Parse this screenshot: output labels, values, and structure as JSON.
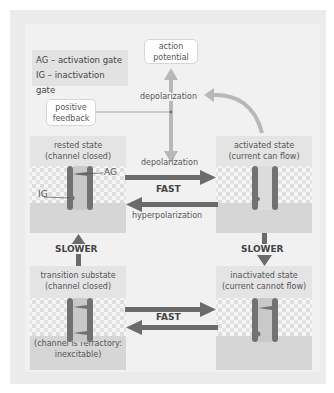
{
  "legend": {
    "ag": "AG – activation gate",
    "ig": "IG – inactivation gate"
  },
  "bubbles": {
    "action_potential": [
      "action",
      "potential"
    ],
    "positive_feedback": [
      "positive",
      "feedback"
    ]
  },
  "labels": {
    "depolarization_top": "depolarization",
    "depolarization_mid": "depolarization",
    "hyperpolarization": "hyperpolarization",
    "fast_top": "FAST",
    "fast_bottom": "FAST",
    "slower_left": "SLOWER",
    "slower_right": "SLOWER",
    "ag": "AG",
    "ig": "IG"
  },
  "states": {
    "rested": [
      "rested state",
      "(channel closed)"
    ],
    "activated": [
      "activated state",
      "(current can flow)"
    ],
    "transition": [
      "transition substate",
      "(channel closed)"
    ],
    "inactivated": [
      "inactivated state",
      "(current cannot flow)"
    ],
    "refractory_note": [
      "(channel is refractory:",
      "inexcitable)"
    ]
  },
  "colors": {
    "arrow_dark": "#6b6b6b",
    "arrow_light": "#b8b8b8",
    "channel": "#727272",
    "panel_title_bg": "#e4e4e4",
    "cytoplasm": "#d6d6d6"
  }
}
